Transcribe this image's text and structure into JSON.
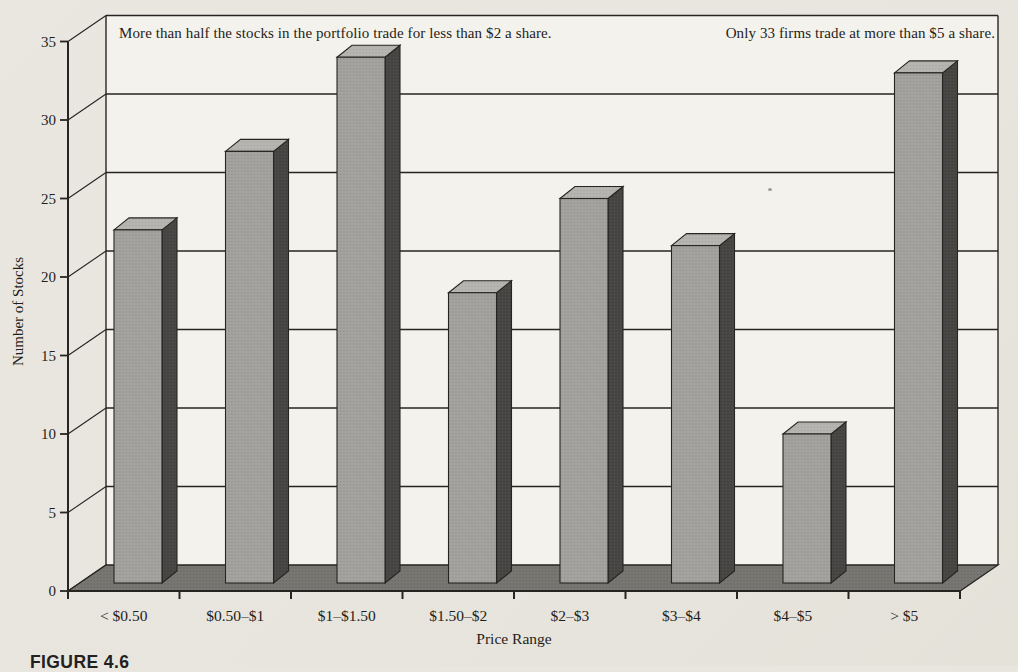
{
  "figure": {
    "label": "FIGURE 4.6"
  },
  "annotations": {
    "left": "More than half the stocks in the portfolio trade for less than $2 a share.",
    "right": "Only 33 firms trade at more than $5 a share."
  },
  "chart_data": {
    "type": "bar",
    "projection": "3d",
    "title": "",
    "xlabel": "Price Range",
    "ylabel": "Number of Stocks",
    "categories": [
      "< $0.50",
      "$0.50–$1",
      "$1–$1.50",
      "$1.50–$2",
      "$2–$3",
      "$3–$4",
      "$4–$5",
      "> $5"
    ],
    "values": [
      23,
      28,
      34,
      19,
      25,
      22,
      10,
      33
    ],
    "ylim": [
      0,
      35
    ],
    "yticks": [
      0,
      5,
      10,
      15,
      20,
      25,
      30,
      35
    ],
    "grid": true,
    "legend": false,
    "colors": {
      "paper": "#e9e6df",
      "wall": "#f4f2ec",
      "bar_front": "#a6a4a1",
      "bar_front_dot": "#908e8a",
      "bar_top": "#b8b6b2",
      "bar_top_dot": "#a5a39f",
      "bar_side": "#4a4947",
      "bar_side_dot": "#393836",
      "floor": "#7a7874",
      "floor_dot": "#67655f",
      "line": "#262522",
      "text": "#1f1e1b"
    }
  }
}
